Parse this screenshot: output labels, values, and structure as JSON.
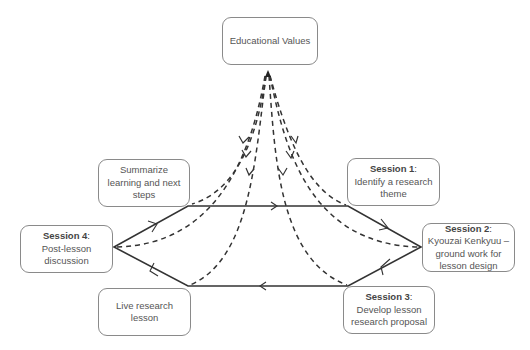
{
  "diagram": {
    "center": {
      "label": "Educational Values"
    },
    "nodes": [
      {
        "id": "summarize",
        "title": "",
        "text": "Summarize learning and next steps"
      },
      {
        "id": "session1",
        "title": "Session 1",
        "text": "Identify a research theme"
      },
      {
        "id": "session2",
        "title": "Session 2",
        "text": "Kyouzai Kenkyuu – ground work for lesson design"
      },
      {
        "id": "session3",
        "title": "Session 3",
        "text": "Develop lesson research proposal"
      },
      {
        "id": "live",
        "title": "",
        "text": "Live research lesson"
      },
      {
        "id": "session4",
        "title": "Session 4",
        "text": "Post-lesson discussion"
      }
    ],
    "cycle_direction": "clockwise: Session 4 → Summarize → Session 1 → Session 2 → Session 3 → Live research lesson → Session 4",
    "influence_lines": "dashed arrows from Educational Values to each cycle node",
    "colors": {
      "line": "#333333",
      "box_border": "#8a8a8a",
      "text": "#555555"
    }
  }
}
